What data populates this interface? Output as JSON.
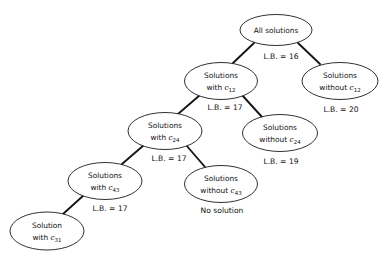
{
  "diagram": {
    "type": "branch-and-bound-tree",
    "title": "",
    "nodes": [
      {
        "id": "all-solutions",
        "line1": "All solutions",
        "line2": "",
        "var": "",
        "sub": "",
        "cx": 276,
        "cy": 30,
        "rx": 36,
        "ry": 15.5,
        "single_line": true
      },
      {
        "id": "solutions-with-c12",
        "line1": "Solutions",
        "line2": "with ",
        "var": "c",
        "sub": "12",
        "cx": 221,
        "cy": 81,
        "rx": 36.5,
        "ry": 18.5,
        "single_line": false
      },
      {
        "id": "solutions-without-c12",
        "line1": "Solutions",
        "line2": "without ",
        "var": "c",
        "sub": "12",
        "cx": 340,
        "cy": 81,
        "rx": 38,
        "ry": 18.5,
        "single_line": false
      },
      {
        "id": "solutions-with-c24",
        "line1": "Solutions",
        "line2": "with ",
        "var": "c",
        "sub": "24",
        "cx": 165,
        "cy": 131,
        "rx": 37,
        "ry": 18.5,
        "single_line": false
      },
      {
        "id": "solutions-without-c24",
        "line1": "Solutions",
        "line2": "without ",
        "var": "c",
        "sub": "24",
        "cx": 280,
        "cy": 133,
        "rx": 37.5,
        "ry": 18.5,
        "single_line": false
      },
      {
        "id": "solutions-with-c43",
        "line1": "Solutions",
        "line2": "with ",
        "var": "c",
        "sub": "43",
        "cx": 105,
        "cy": 181,
        "rx": 37,
        "ry": 18.5,
        "single_line": false
      },
      {
        "id": "solutions-without-c43",
        "line1": "Solutions",
        "line2": "without ",
        "var": "c",
        "sub": "43",
        "cx": 221,
        "cy": 184,
        "rx": 36.5,
        "ry": 18.5,
        "single_line": false
      },
      {
        "id": "solution-with-c31",
        "line1": "Solution",
        "line2": "with ",
        "var": "c",
        "sub": "31",
        "cx": 47,
        "cy": 231,
        "rx": 37,
        "ry": 19,
        "single_line": false
      }
    ],
    "edges": [
      {
        "id": "edge-all-to-with-c12",
        "x1": 254,
        "y1": 43,
        "x2": 233,
        "y2": 63
      },
      {
        "id": "edge-all-to-without-c12",
        "x1": 298,
        "y1": 43,
        "x2": 320,
        "y2": 64
      },
      {
        "id": "edge-c12-to-with-c24",
        "x1": 200,
        "y1": 95,
        "x2": 178,
        "y2": 114
      },
      {
        "id": "edge-c12-to-without-c24",
        "x1": 242,
        "y1": 95,
        "x2": 262,
        "y2": 117
      },
      {
        "id": "edge-c24-to-with-c43",
        "x1": 144,
        "y1": 145,
        "x2": 122,
        "y2": 164
      },
      {
        "id": "edge-c24-to-without-c43",
        "x1": 186,
        "y1": 145,
        "x2": 205,
        "y2": 167
      },
      {
        "id": "edge-c43-to-with-c31",
        "x1": 84,
        "y1": 195,
        "x2": 63,
        "y2": 214
      }
    ],
    "lower_bound_labels": [
      {
        "id": "lb-16",
        "text": "L.B. = 16",
        "x": 281,
        "y": 57
      },
      {
        "id": "lb-20",
        "text": "L.B. = 20",
        "x": 341,
        "y": 110
      },
      {
        "id": "lb-17-c12",
        "text": "L.B. = 17",
        "x": 225,
        "y": 108
      },
      {
        "id": "lb-19",
        "text": "L.B. = 19",
        "x": 281,
        "y": 162
      },
      {
        "id": "lb-17-c24",
        "text": "L.B. = 17",
        "x": 169,
        "y": 159
      },
      {
        "id": "lb-17-c43",
        "text": "L.B. = 17",
        "x": 110,
        "y": 209
      }
    ],
    "leaf_notes": [
      {
        "id": "no-solution-note",
        "text": "No solution",
        "x": 222,
        "y": 211
      }
    ],
    "colors": {
      "background": "#ffffff",
      "node_stroke": "#1a1a1a",
      "edge_stroke": "#161616",
      "text": "#111111"
    }
  }
}
